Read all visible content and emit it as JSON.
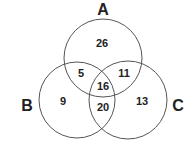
{
  "diagram": {
    "type": "venn-3",
    "sets": [
      {
        "label": "A",
        "cx": 103,
        "cy": 58,
        "r": 39
      },
      {
        "label": "B",
        "cx": 77,
        "cy": 100,
        "r": 38
      },
      {
        "label": "C",
        "cx": 128,
        "cy": 100,
        "r": 39
      }
    ],
    "regions": {
      "A_only": "26",
      "B_only": "9",
      "C_only": "13",
      "A_and_B": "5",
      "A_and_C": "11",
      "B_and_C": "20",
      "A_and_B_and_C": "16"
    },
    "colors": {
      "stroke": "#555555",
      "text": "#222222",
      "background": "#ffffff"
    }
  }
}
